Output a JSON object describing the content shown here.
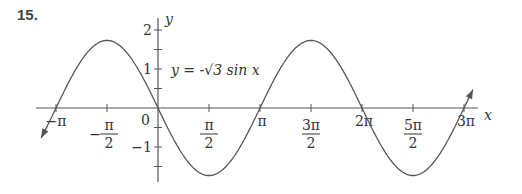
{
  "problem_number": "15.",
  "chart_data": {
    "type": "line",
    "title": "",
    "equation_label": "y = -√3 sin x",
    "xlabel": "x",
    "ylabel": "y",
    "x_ticks": [
      "-π",
      "-π/2",
      "0",
      "π/2",
      "π",
      "3π/2",
      "2π",
      "5π/2",
      "3π"
    ],
    "y_ticks": [
      "2",
      "1",
      "-1"
    ],
    "xlim": [
      -3.5,
      10.5
    ],
    "ylim": [
      -2,
      2.3
    ],
    "series": [
      {
        "name": "y = -√3 sin x",
        "function": "-sqrt(3)*sin(x)",
        "x_range": [
          -3.6,
          9.7
        ],
        "amplitude": 1.732,
        "period": 6.283
      }
    ],
    "grid": false
  }
}
